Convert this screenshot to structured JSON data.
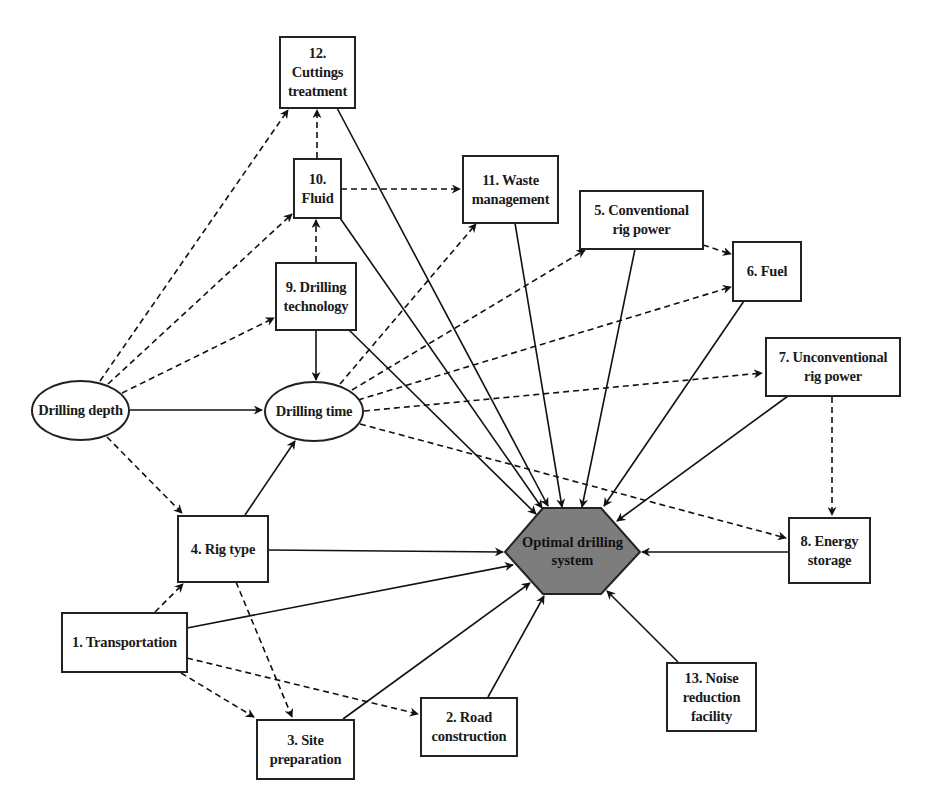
{
  "diagram": {
    "center": {
      "id": "optimal",
      "label": "Optimal drilling\nsystem",
      "fill": "#7d7d7d"
    },
    "nodes": [
      {
        "id": "depth",
        "shape": "ellipse",
        "label": "Drilling depth"
      },
      {
        "id": "time",
        "shape": "ellipse",
        "label": "Drilling time"
      },
      {
        "id": "n1",
        "shape": "box",
        "label": "1. Transportation"
      },
      {
        "id": "n2",
        "shape": "box",
        "label": "2. Road\nconstruction"
      },
      {
        "id": "n3",
        "shape": "box",
        "label": "3. Site\npreparation"
      },
      {
        "id": "n4",
        "shape": "box",
        "label": "4. Rig type"
      },
      {
        "id": "n5",
        "shape": "box",
        "label": "5. Conventional\nrig power"
      },
      {
        "id": "n6",
        "shape": "box",
        "label": "6. Fuel"
      },
      {
        "id": "n7",
        "shape": "box",
        "label": "7. Unconventional\nrig power"
      },
      {
        "id": "n8",
        "shape": "box",
        "label": "8. Energy\nstorage"
      },
      {
        "id": "n9",
        "shape": "box",
        "label": "9. Drilling\ntechnology"
      },
      {
        "id": "n10",
        "shape": "box",
        "label": "10.\nFluid"
      },
      {
        "id": "n11",
        "shape": "box",
        "label": "11. Waste\nmanagement"
      },
      {
        "id": "n12",
        "shape": "box",
        "label": "12.\nCuttings\ntreatment"
      },
      {
        "id": "n13",
        "shape": "box",
        "label": "13. Noise\nreduction\nfacility"
      }
    ],
    "edges": [
      {
        "from": "depth",
        "to": "time",
        "style": "solid"
      },
      {
        "from": "depth",
        "to": "n12",
        "style": "dashed"
      },
      {
        "from": "depth",
        "to": "n10",
        "style": "dashed"
      },
      {
        "from": "depth",
        "to": "n9",
        "style": "dashed"
      },
      {
        "from": "depth",
        "to": "n4",
        "style": "dashed"
      },
      {
        "from": "n9",
        "to": "time",
        "style": "solid"
      },
      {
        "from": "n9",
        "to": "n10",
        "style": "dashed"
      },
      {
        "from": "n10",
        "to": "n12",
        "style": "dashed"
      },
      {
        "from": "n10",
        "to": "n11",
        "style": "dashed"
      },
      {
        "from": "n4",
        "to": "time",
        "style": "solid"
      },
      {
        "from": "n1",
        "to": "n4",
        "style": "dashed"
      },
      {
        "from": "n4",
        "to": "n3",
        "style": "dashed"
      },
      {
        "from": "n1",
        "to": "n3",
        "style": "dashed"
      },
      {
        "from": "n1",
        "to": "n2",
        "style": "dashed"
      },
      {
        "from": "time",
        "to": "n11",
        "style": "dashed"
      },
      {
        "from": "time",
        "to": "n5",
        "style": "dashed"
      },
      {
        "from": "time",
        "to": "n6",
        "style": "dashed"
      },
      {
        "from": "time",
        "to": "n7",
        "style": "dashed"
      },
      {
        "from": "time",
        "to": "n8",
        "style": "dashed"
      },
      {
        "from": "n5",
        "to": "n6",
        "style": "dashed"
      },
      {
        "from": "n7",
        "to": "n8",
        "style": "dashed"
      },
      {
        "from": "n1",
        "to": "optimal",
        "style": "solid"
      },
      {
        "from": "n2",
        "to": "optimal",
        "style": "solid"
      },
      {
        "from": "n3",
        "to": "optimal",
        "style": "solid"
      },
      {
        "from": "n4",
        "to": "optimal",
        "style": "solid"
      },
      {
        "from": "n5",
        "to": "optimal",
        "style": "solid"
      },
      {
        "from": "n6",
        "to": "optimal",
        "style": "solid"
      },
      {
        "from": "n7",
        "to": "optimal",
        "style": "solid"
      },
      {
        "from": "n8",
        "to": "optimal",
        "style": "solid"
      },
      {
        "from": "n9",
        "to": "optimal",
        "style": "solid"
      },
      {
        "from": "n10",
        "to": "optimal",
        "style": "solid"
      },
      {
        "from": "n11",
        "to": "optimal",
        "style": "solid"
      },
      {
        "from": "n12",
        "to": "optimal",
        "style": "solid"
      },
      {
        "from": "n13",
        "to": "optimal",
        "style": "solid"
      }
    ]
  },
  "labels": {
    "depth": "Drilling depth",
    "time": "Drilling time",
    "optimal": "Optimal drilling\nsystem",
    "n1": "1. Transportation",
    "n2": "2. Road\nconstruction",
    "n3": "3. Site\npreparation",
    "n4": "4. Rig type",
    "n5": "5. Conventional\nrig power",
    "n6": "6. Fuel",
    "n7": "7. Unconventional\nrig power",
    "n8": "8. Energy\nstorage",
    "n9": "9. Drilling\ntechnology",
    "n10": "10.\nFluid",
    "n11": "11. Waste\nmanagement",
    "n12": "12.\nCuttings\ntreatment",
    "n13": "13. Noise\nreduction\nfacility"
  }
}
